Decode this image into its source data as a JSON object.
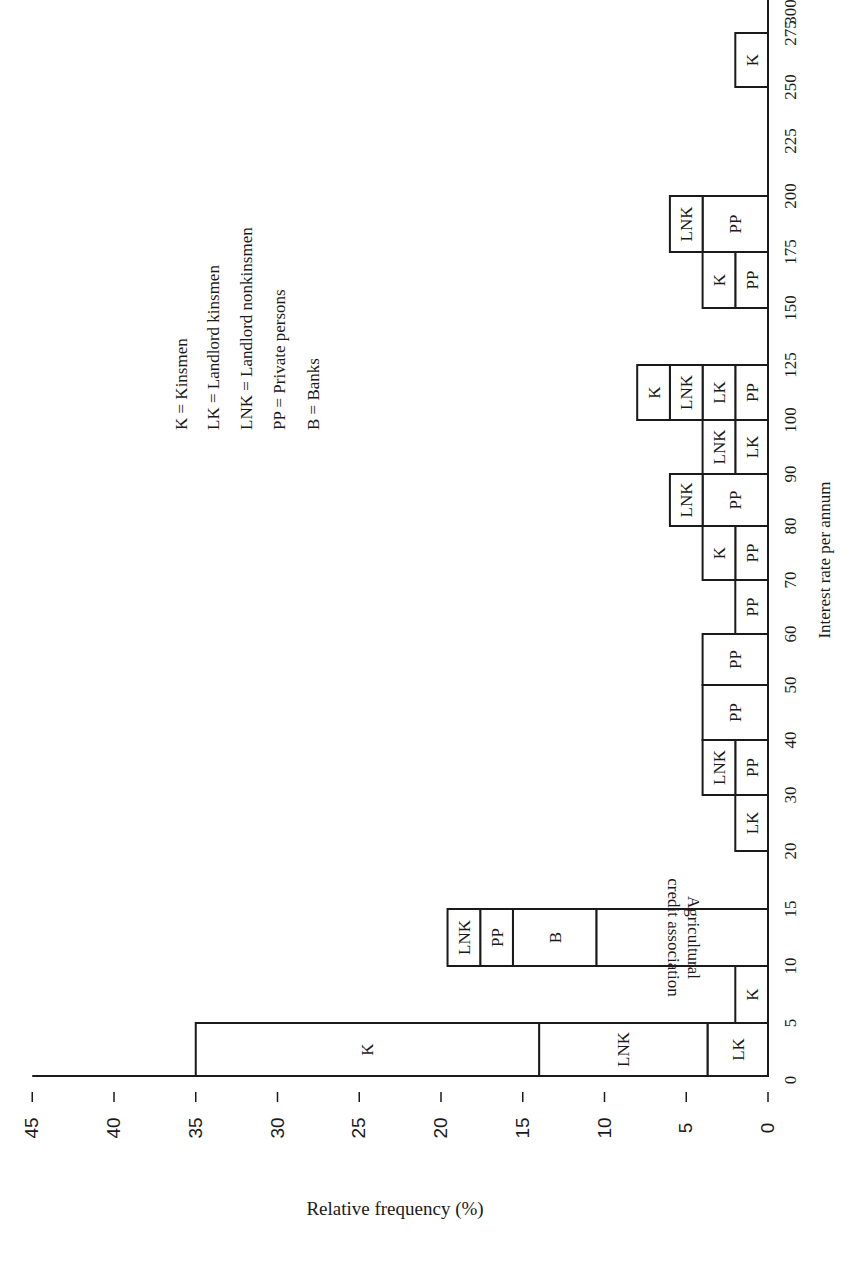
{
  "chart_data": {
    "type": "bar",
    "orientation": "stacked histogram, rendered rotated 90 degrees (rate axis vertical on right, frequency axis horizontal at bottom)",
    "title": "",
    "xlabel": "Interest rate per annum",
    "ylabel": "Relative frequency (%)",
    "ylim": [
      0,
      45
    ],
    "y_ticks": [
      "0",
      "5",
      "10",
      "15",
      "20",
      "25",
      "30",
      "35",
      "40",
      "45"
    ],
    "x_ticks": [
      "0",
      "5",
      "10",
      "15",
      "20",
      "30",
      "40",
      "50",
      "60",
      "70",
      "80",
      "90",
      "100",
      "125",
      "150",
      "175",
      "200",
      "225",
      "250",
      "275",
      "300"
    ],
    "grid": false,
    "legend": [
      {
        "code": "K",
        "label": "Kinsmen"
      },
      {
        "code": "LK",
        "label": "Landlord kinsmen"
      },
      {
        "code": "LNK",
        "label": "Landlord nonkinsmen"
      },
      {
        "code": "PP",
        "label": "Private persons"
      },
      {
        "code": "B",
        "label": "Banks"
      }
    ],
    "bins": [
      {
        "range": [
          0,
          5
        ],
        "segments": [
          {
            "label": "LK",
            "value": 3.7
          },
          {
            "label": "LNK",
            "value": 10.3
          },
          {
            "label": "K",
            "value": 21.0
          }
        ],
        "total": 35.0
      },
      {
        "range": [
          5,
          10
        ],
        "segments": [
          {
            "label": "K",
            "value": 2.0
          }
        ],
        "total": 2.0
      },
      {
        "range": [
          10,
          15
        ],
        "segments": [
          {
            "label": "Agricultural credit association",
            "value": 10.5
          },
          {
            "label": "B",
            "value": 5.1
          },
          {
            "label": "PP",
            "value": 2.0
          },
          {
            "label": "LNK",
            "value": 2.0
          }
        ],
        "total": 19.6
      },
      {
        "range": [
          20,
          30
        ],
        "segments": [
          {
            "label": "LK",
            "value": 2.0
          }
        ],
        "total": 2.0
      },
      {
        "range": [
          30,
          40
        ],
        "segments": [
          {
            "label": "PP",
            "value": 2.0
          },
          {
            "label": "LNK",
            "value": 2.0
          }
        ],
        "total": 4.0
      },
      {
        "range": [
          40,
          50
        ],
        "segments": [
          {
            "label": "PP",
            "value": 4.0
          }
        ],
        "total": 4.0
      },
      {
        "range": [
          50,
          60
        ],
        "segments": [
          {
            "label": "PP",
            "value": 4.0
          }
        ],
        "total": 4.0
      },
      {
        "range": [
          60,
          70
        ],
        "segments": [
          {
            "label": "PP",
            "value": 2.0
          }
        ],
        "total": 2.0
      },
      {
        "range": [
          70,
          80
        ],
        "segments": [
          {
            "label": "PP",
            "value": 2.0
          },
          {
            "label": "K",
            "value": 2.0
          }
        ],
        "total": 4.0
      },
      {
        "range": [
          80,
          90
        ],
        "segments": [
          {
            "label": "PP",
            "value": 4.0
          },
          {
            "label": "LNK",
            "value": 2.0
          }
        ],
        "total": 6.0
      },
      {
        "range": [
          90,
          100
        ],
        "segments": [
          {
            "label": "LK",
            "value": 2.0
          },
          {
            "label": "LNK",
            "value": 2.0
          }
        ],
        "total": 4.0
      },
      {
        "range": [
          100,
          125
        ],
        "segments": [
          {
            "label": "PP",
            "value": 2.0
          },
          {
            "label": "LK",
            "value": 2.0
          },
          {
            "label": "LNK",
            "value": 2.0
          },
          {
            "label": "K",
            "value": 2.0
          }
        ],
        "total": 8.0
      },
      {
        "range": [
          150,
          175
        ],
        "segments": [
          {
            "label": "PP",
            "value": 2.0
          },
          {
            "label": "K",
            "value": 2.0
          }
        ],
        "total": 4.0
      },
      {
        "range": [
          175,
          200
        ],
        "segments": [
          {
            "label": "PP",
            "value": 4.0
          },
          {
            "label": "LNK",
            "value": 2.0
          }
        ],
        "total": 6.0
      },
      {
        "range": [
          250,
          275
        ],
        "segments": [
          {
            "label": "K",
            "value": 2.0
          }
        ],
        "total": 2.0
      }
    ]
  },
  "legend_lines": [
    "K  =  Kinsmen",
    "LK  =  Landlord kinsmen",
    "LNK  =  Landlord nonkinsmen",
    "PP  =  Private persons",
    "B  =  Banks"
  ],
  "labels": {
    "xlabel": "Interest rate per annum",
    "ylabel": "Relative frequency (%)"
  }
}
